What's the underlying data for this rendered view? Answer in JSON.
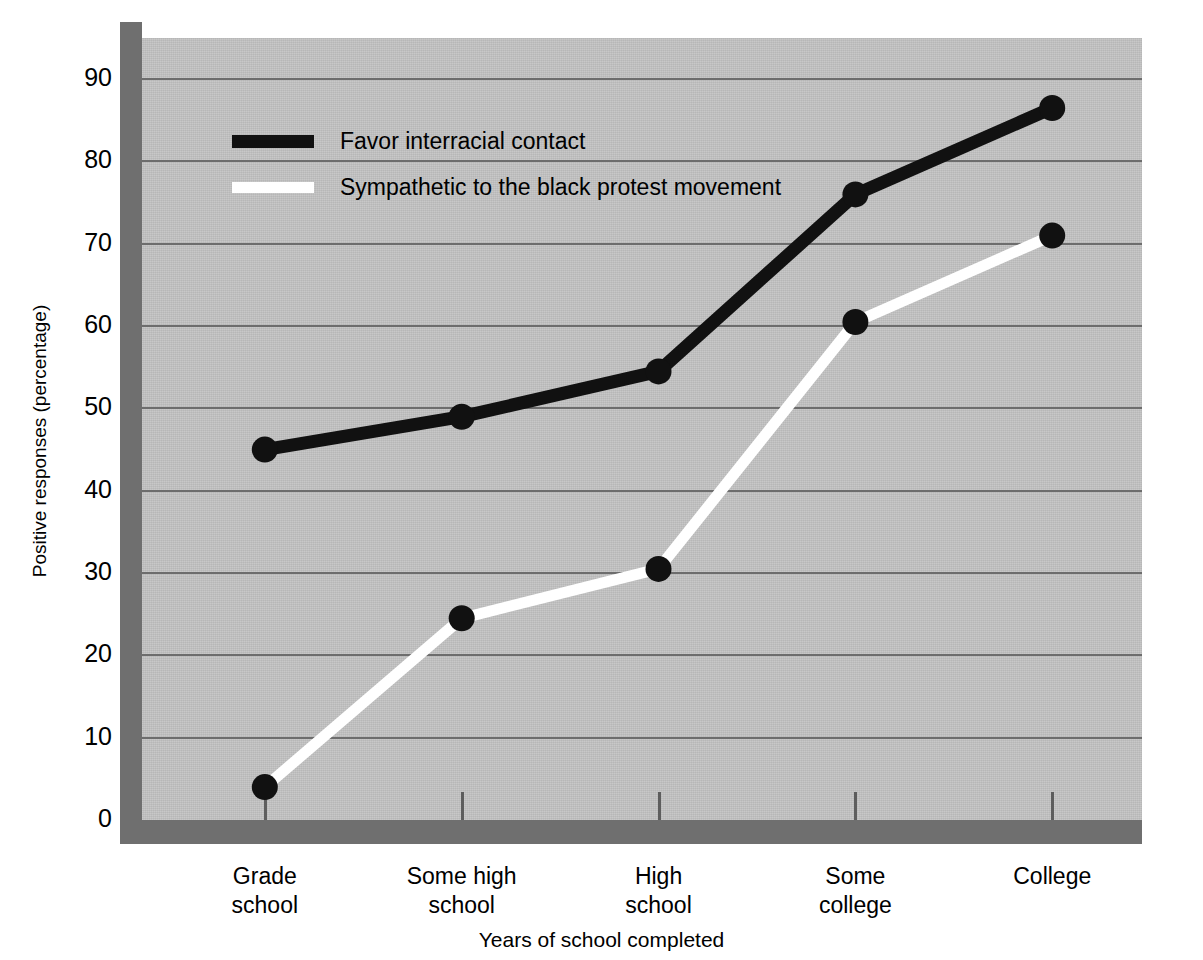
{
  "chart_data": {
    "type": "line",
    "title": "",
    "xlabel": "Years of school completed",
    "ylabel": "Positive responses (percentage)",
    "categories": [
      "Grade school",
      "Some high school",
      "High school",
      "Some college",
      "College"
    ],
    "category_lines": [
      [
        "Grade",
        "school"
      ],
      [
        "Some high",
        "school"
      ],
      [
        "High",
        "school"
      ],
      [
        "Some",
        "college"
      ],
      [
        "College"
      ]
    ],
    "series": [
      {
        "name": "Favor interracial contact",
        "color": "#111111",
        "marker_color": "#111111",
        "values": [
          45,
          49,
          54.5,
          76,
          86.5
        ]
      },
      {
        "name": "Sympathetic to the black protest movement",
        "color": "#ffffff",
        "marker_color": "#111111",
        "values": [
          4,
          24.5,
          30.5,
          60.5,
          71
        ]
      }
    ],
    "ylim": [
      0,
      95
    ],
    "yticks": [
      0,
      10,
      20,
      30,
      40,
      50,
      60,
      70,
      80,
      90
    ],
    "ytick_labels": [
      "0",
      "10",
      "20",
      "30",
      "40",
      "50",
      "60",
      "70",
      "80",
      "90"
    ],
    "grid": true,
    "grid_color": "#6d6d6d",
    "legend_position": "top-left",
    "plot_background": "#c3c3c3",
    "frame_color": "#6f6f6f"
  },
  "legend": {
    "entries": [
      {
        "label": "Favor interracial contact",
        "swatch": "black"
      },
      {
        "label": "Sympathetic to the black protest movement",
        "swatch": "white"
      }
    ]
  },
  "axes": {
    "y_title": "Positive responses (percentage)",
    "x_title": "Years of school completed"
  }
}
